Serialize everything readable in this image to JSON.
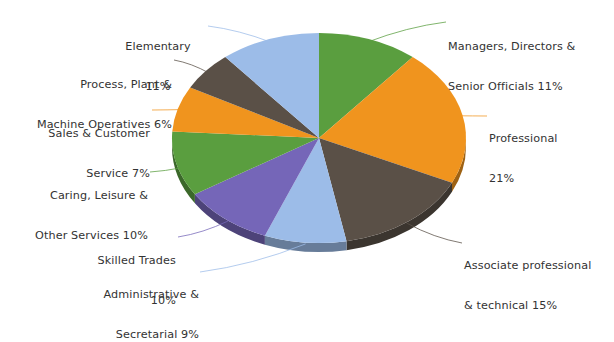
{
  "chart_data": {
    "type": "pie",
    "title": "",
    "subtitle": "",
    "xlabel": "",
    "ylabel": "",
    "legend_position": "none",
    "grid": false,
    "units": "percent",
    "total": 100,
    "style": "3d-exploded-none",
    "start_angle_deg": 0,
    "direction": "clockwise",
    "categories": [
      "Managers, Directors & Senior Officials",
      "Professional",
      "Associate professional & technical",
      "Administrative & Secretarial",
      "Skilled Trades",
      "Caring, Leisure & Other Services",
      "Sales & Customer Service",
      "Process, Plant & Machine Operatives",
      "Elementary"
    ],
    "values": [
      11,
      21,
      15,
      9,
      10,
      10,
      7,
      6,
      11
    ],
    "colors": [
      "#5a9e3f",
      "#f0941e",
      "#5a5047",
      "#9cbce8",
      "#7566b8",
      "#5a9e3f",
      "#f0941e",
      "#5a5047",
      "#9cbce8"
    ],
    "slices": [
      {
        "label": "Managers, Directors &",
        "label_line2": "Senior Officials 11%",
        "name": "Managers, Directors & Senior Officials",
        "value": 11,
        "color": "#5a9e3f"
      },
      {
        "label": "Professional",
        "label_line2": "21%",
        "name": "Professional",
        "value": 21,
        "color": "#f0941e"
      },
      {
        "label": "Associate professional",
        "label_line2": "& technical 15%",
        "name": "Associate professional & technical",
        "value": 15,
        "color": "#5a5047"
      },
      {
        "label": "Administrative &",
        "label_line2": "Secretarial 9%",
        "name": "Administrative & Secretarial",
        "value": 9,
        "color": "#9cbce8"
      },
      {
        "label": "Skilled Trades",
        "label_line2": "10%",
        "name": "Skilled Trades",
        "value": 10,
        "color": "#7566b8"
      },
      {
        "label": "Caring, Leisure &",
        "label_line2": "Other Services 10%",
        "name": "Caring, Leisure & Other Services",
        "value": 10,
        "color": "#5a9e3f"
      },
      {
        "label": "Sales & Customer",
        "label_line2": "Service 7%",
        "name": "Sales & Customer Service",
        "value": 7,
        "color": "#f0941e"
      },
      {
        "label": "Process, Plant &",
        "label_line2": "Machine Operatives 6%",
        "name": "Process, Plant & Machine Operatives",
        "value": 6,
        "color": "#5a5047"
      },
      {
        "label": "Elementary",
        "label_line2": "11%",
        "name": "Elementary",
        "value": 11,
        "color": "#9cbce8"
      }
    ]
  },
  "geometry": {
    "center_x": 319,
    "center_y": 138,
    "radius_x": 147,
    "radius_y": 105,
    "depth": 9
  },
  "callouts": {
    "managers": {
      "line1": "Managers, Directors &",
      "line2": "Senior Officials 11%"
    },
    "professional": {
      "line1": "Professional",
      "line2": "21%"
    },
    "associate": {
      "line1": "Associate professional",
      "line2": "& technical 15%"
    },
    "administrative": {
      "line1": "Administrative &",
      "line2": "Secretarial 9%"
    },
    "skilled": {
      "line1": "Skilled Trades",
      "line2": "10%"
    },
    "caring": {
      "line1": "Caring, Leisure &",
      "line2": "Other Services 10%"
    },
    "sales": {
      "line1": "Sales & Customer",
      "line2": "Service 7%"
    },
    "process": {
      "line1": "Process, Plant &",
      "line2": "Machine Operatives 6%"
    },
    "elementary": {
      "line1": "Elementary",
      "line2": "11%"
    }
  }
}
